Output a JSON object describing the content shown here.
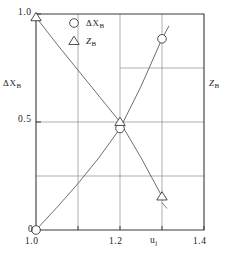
{
  "chart_data": {
    "type": "line",
    "title": "",
    "xlabel": "u_j",
    "ylabel_left": "ΔX_B",
    "ylabel_right": "Z_B",
    "xlim": [
      1.0,
      1.4
    ],
    "ylim": [
      0.0,
      1.0
    ],
    "grid": true,
    "legend_position": "upper-center",
    "x_ticks": [
      1.0,
      1.1,
      1.2,
      1.3,
      1.4
    ],
    "x_tick_labels": [
      "1.0",
      "",
      "1.2",
      "",
      "1.4"
    ],
    "y_ticks": [
      0.0,
      0.25,
      0.5,
      0.75,
      1.0
    ],
    "y_tick_labels": [
      "0",
      "",
      "0.5",
      "",
      "1.0"
    ],
    "series": [
      {
        "name": "ΔX_B",
        "marker": "circle",
        "x": [
          1.0,
          1.05,
          1.1,
          1.15,
          1.2,
          1.25,
          1.3
        ],
        "values": [
          0.0,
          0.105,
          0.215,
          0.335,
          0.47,
          0.665,
          0.885
        ],
        "marker_points": [
          {
            "x": 1.0,
            "y": 0.0
          },
          {
            "x": 1.2,
            "y": 0.47
          },
          {
            "x": 1.3,
            "y": 0.885
          }
        ]
      },
      {
        "name": "Z_B",
        "marker": "triangle",
        "x": [
          1.0,
          1.05,
          1.1,
          1.15,
          1.2,
          1.25,
          1.3
        ],
        "values": [
          0.985,
          0.86,
          0.74,
          0.62,
          0.5,
          0.335,
          0.155
        ],
        "marker_points": [
          {
            "x": 1.0,
            "y": 0.985
          },
          {
            "x": 1.2,
            "y": 0.5
          },
          {
            "x": 1.3,
            "y": 0.155
          }
        ]
      }
    ]
  },
  "axis": {
    "y_label_top": "1.0",
    "y_label_mid": "0.5",
    "y_label_bottom": "0",
    "x_label_left": "1.0",
    "x_label_mid": "1.2",
    "x_label_right": "1.4",
    "x_axis_name": "u",
    "x_axis_name_sub": "j",
    "left_label_main": "ΔX",
    "left_label_sub": "B",
    "right_label_main": "Z",
    "right_label_sub": "B"
  },
  "legend": {
    "entries": [
      {
        "marker": "circle",
        "label_main": "ΔX",
        "label_sub": "B"
      },
      {
        "marker": "triangle",
        "label_main": "Z",
        "label_sub": "B"
      }
    ]
  },
  "colors": {
    "axis": "#3a3a3a",
    "grid": "#8d8d8d",
    "curve": "#4a4a4a",
    "marker_fill": "#ffffff",
    "background": "#ffffff"
  }
}
